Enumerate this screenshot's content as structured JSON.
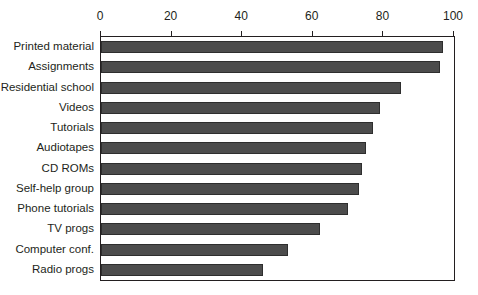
{
  "chart_data": {
    "type": "bar",
    "orientation": "horizontal",
    "title": "",
    "subtitle": "",
    "xlabel": "",
    "ylabel": "",
    "xlim": [
      0,
      100
    ],
    "ylim": null,
    "grid": false,
    "legend": null,
    "legend_position": "none",
    "xticks": [
      0,
      20,
      40,
      60,
      80,
      100
    ],
    "xtick_labels": [
      "0",
      "20",
      "40",
      "60",
      "80",
      "100"
    ],
    "categories": [
      "Printed material",
      "Assignments",
      "Residential school",
      "Videos",
      "Tutorials",
      "Audiotapes",
      "CD ROMs",
      "Self-help group",
      "Phone tutorials",
      "TV progs",
      "Computer conf.",
      "Radio progs"
    ],
    "values": [
      97,
      96,
      85,
      79,
      77,
      75,
      74,
      73,
      70,
      62,
      53,
      46
    ],
    "bar_color": "#4c4c4c",
    "bar_edge_color": "#2e2e2e",
    "axis_color": "#231f20",
    "background_color": "#ffffff"
  }
}
